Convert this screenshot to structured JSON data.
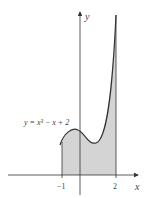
{
  "diagram": {
    "equation_label": "y = x³ − x + 2",
    "x_axis_label": "x",
    "y_axis_label": "y",
    "tick_labels": [
      "−1",
      "2"
    ],
    "shaded_region": {
      "from": -1,
      "to": 2
    },
    "colors": {
      "fill": "#d4d4d4",
      "curve": "#333333",
      "axes": "#333333"
    }
  }
}
